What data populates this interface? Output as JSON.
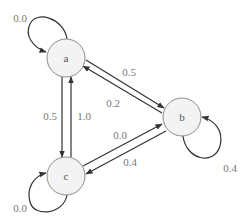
{
  "diagram": {
    "type": "markov-chain-state-diagram",
    "nodes": [
      {
        "id": "a",
        "label": "a",
        "cx": 66,
        "cy": 58,
        "r": 19
      },
      {
        "id": "b",
        "label": "b",
        "cx": 182,
        "cy": 117,
        "r": 19
      },
      {
        "id": "c",
        "label": "c",
        "cx": 66,
        "cy": 176,
        "r": 19
      }
    ],
    "edges": [
      {
        "from": "a",
        "to": "a",
        "label": "0.0"
      },
      {
        "from": "a",
        "to": "b",
        "label": "0.5"
      },
      {
        "from": "b",
        "to": "a",
        "label": "0.2"
      },
      {
        "from": "a",
        "to": "c",
        "label": "0.5"
      },
      {
        "from": "c",
        "to": "a",
        "label": "1.0"
      },
      {
        "from": "c",
        "to": "b",
        "label": "0.0"
      },
      {
        "from": "b",
        "to": "c",
        "label": "0.4"
      },
      {
        "from": "b",
        "to": "b",
        "label": "0.4"
      },
      {
        "from": "c",
        "to": "c",
        "label": "0.0"
      }
    ]
  },
  "labels": {
    "node_a": "a",
    "node_b": "b",
    "node_c": "c",
    "edge_aa": "0.0",
    "edge_ab": "0.5",
    "edge_ba": "0.2",
    "edge_ac": "0.5",
    "edge_ca": "1.0",
    "edge_cb": "0.0",
    "edge_bc": "0.4",
    "edge_bb": "0.4",
    "edge_cc": "0.0"
  }
}
